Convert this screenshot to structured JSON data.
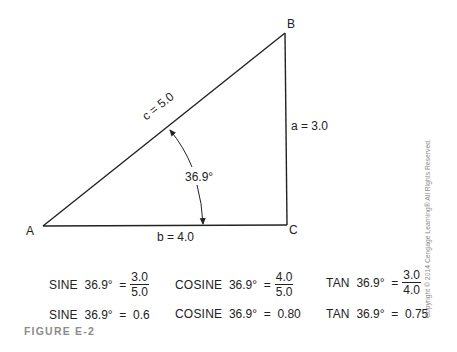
{
  "diagram": {
    "vertices": [
      {
        "id": "A",
        "label": "A",
        "x": 43,
        "y": 226
      },
      {
        "id": "B",
        "label": "B",
        "x": 285,
        "y": 33
      },
      {
        "id": "C",
        "label": "C",
        "x": 287,
        "y": 225
      }
    ],
    "sides": {
      "hypotenuse": "c = 5.0",
      "opposite": "a = 3.0",
      "adjacent": "b = 4.0"
    },
    "angle_label": "36.9°",
    "colors": {
      "line": "#222222",
      "text": "#222222",
      "caption": "#8c8c8c"
    }
  },
  "equations": {
    "row1": [
      {
        "fn": "SINE",
        "angle": "36.9°",
        "eq": "=",
        "num": "3.0",
        "den": "5.0"
      },
      {
        "fn": "COSINE",
        "angle": "36.9°",
        "eq": "=",
        "num": "4.0",
        "den": "5.0"
      },
      {
        "fn": "TAN",
        "angle": "36.9°",
        "eq": "=",
        "num": "3.0",
        "den": "4.0"
      }
    ],
    "row2": [
      {
        "fn": "SINE",
        "angle": "36.9°",
        "eq": "=",
        "value": "0.6"
      },
      {
        "fn": "COSINE",
        "angle": "36.9°",
        "eq": "=",
        "value": "0.80"
      },
      {
        "fn": "TAN",
        "angle": "36.9°",
        "eq": "=",
        "value": "0.75"
      }
    ]
  },
  "caption": "FIGURE E-2",
  "copyright": "Copyright © 2014 Cengage Learning® All Rights Reserved."
}
